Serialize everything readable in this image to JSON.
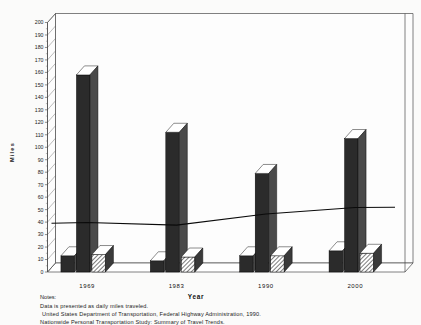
{
  "chart_data": {
    "type": "bar",
    "title": "",
    "xlabel": "Year",
    "ylabel": "Miles",
    "categories": [
      "1969",
      "1983",
      "1990",
      "2000"
    ],
    "ylim": [
      0,
      200
    ],
    "ytick_step": 10,
    "yticks": [
      0,
      10,
      20,
      30,
      40,
      50,
      60,
      70,
      80,
      90,
      100,
      110,
      120,
      130,
      140,
      150,
      160,
      170,
      180,
      190,
      200
    ],
    "grid": false,
    "legend": "none",
    "series": [
      {
        "name": "Series 1",
        "style": "solid-dark-3d",
        "values": [
          13,
          9,
          13,
          17
        ]
      },
      {
        "name": "Series 2",
        "style": "solid-dark-3d",
        "values": [
          158,
          112,
          79,
          107
        ]
      },
      {
        "name": "Series 3",
        "style": "hatched-3d",
        "values": [
          14,
          12,
          13,
          15
        ]
      },
      {
        "name": "Trend line",
        "style": "line",
        "values": [
          36,
          34,
          43,
          48
        ]
      }
    ],
    "annotations": []
  },
  "axis": {
    "y_title": "Miles",
    "x_title": "Year"
  },
  "notes": {
    "heading": "Notes:",
    "lines": [
      "Data is presented as daily miles traveled.",
      "United States Department of Transportation,  Federal Highway Administration, 1990.",
      "Nationwide Personal Transportation Study:   Summary of Travel Trends."
    ]
  },
  "colors": {
    "bar_dark": "#2b2b2b",
    "bar_side": "#4a4a4a",
    "bar_top": "#ffffff",
    "line": "#0a0a0a",
    "frame": "#4a4a4a",
    "background": "#fbfbfa"
  }
}
